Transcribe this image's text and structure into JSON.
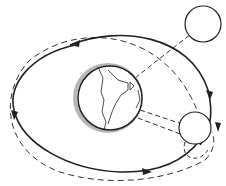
{
  "diagram": {
    "title": "Earth-Moon orbit with spacecraft trajectory",
    "elements": {
      "earth": {
        "label": "Earth",
        "cx": 110,
        "cy": 98,
        "r": 32
      },
      "moon_top": {
        "label": "Moon (far position)",
        "cx": 203,
        "cy": 24,
        "r": 18
      },
      "moon_bottom": {
        "label": "Moon (near position)",
        "cx": 195,
        "cy": 128,
        "r": 16
      }
    },
    "colors": {
      "stroke": "#222222",
      "shadow": "#b8b8b8",
      "background": "#ffffff"
    }
  }
}
